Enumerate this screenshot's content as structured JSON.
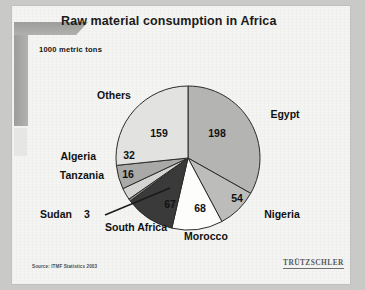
{
  "slide": {
    "title": "Raw material consumption in Africa",
    "subtitle": "1000 metric tons",
    "source": "Source: ITMF Statistics 2003",
    "side_caption": "",
    "logo": "TRÜTZSCHLER"
  },
  "chart_data": {
    "type": "pie",
    "title": "Raw material consumption in Africa",
    "subtitle": "1000 metric tons",
    "unit": "1000 metric tons",
    "total": 597,
    "start_angle": 0,
    "direction": "clockwise",
    "legend": "none",
    "labels_inside": true,
    "categories": [
      "Egypt",
      "Nigeria",
      "Morocco",
      "South Africa",
      "Sudan",
      "Tanzania",
      "Algeria",
      "Others"
    ],
    "values": [
      198,
      54,
      68,
      67,
      3,
      16,
      32,
      159
    ],
    "colors": [
      "#b4b4b2",
      "#bcbcba",
      "#fdfdfb",
      "#3a3a3a",
      "#8f8f8d",
      "#d4d4d2",
      "#a9a9a7",
      "#e2e2e0"
    ],
    "slices": [
      {
        "name": "Egypt",
        "value": 198,
        "label": "198",
        "color": "#b4b4b2"
      },
      {
        "name": "Nigeria",
        "value": 54,
        "label": "54",
        "color": "#bcbcba"
      },
      {
        "name": "Morocco",
        "value": 68,
        "label": "68",
        "color": "#fdfdfb"
      },
      {
        "name": "South Africa",
        "value": 67,
        "label": "67",
        "color": "#3a3a3a"
      },
      {
        "name": "Sudan",
        "value": 3,
        "label": "3",
        "color": "#8f8f8d"
      },
      {
        "name": "Tanzania",
        "value": 16,
        "label": "16",
        "color": "#d4d4d2"
      },
      {
        "name": "Algeria",
        "value": 32,
        "label": "32",
        "color": "#a9a9a7"
      },
      {
        "name": "Others",
        "value": 159,
        "label": "159",
        "color": "#e2e2e0"
      }
    ],
    "value_labels": {
      "egypt": "198",
      "nigeria": "54",
      "morocco": "68",
      "south_africa": "67",
      "sudan": "3",
      "tanzania": "16",
      "algeria": "32",
      "others": "159"
    },
    "category_labels": {
      "egypt": "Egypt",
      "nigeria": "Nigeria",
      "morocco": "Morocco",
      "south_africa": "South Africa",
      "sudan": "Sudan",
      "tanzania": "Tanzania",
      "algeria": "Algeria",
      "others": "Others"
    }
  }
}
